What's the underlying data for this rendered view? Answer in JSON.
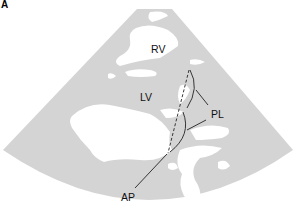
{
  "figure": {
    "panel_letter": "A",
    "colors": {
      "sector_fill": "#d4d4d4",
      "bright_echo": "#ffffff",
      "annotation_line": "#222222"
    }
  },
  "labels": {
    "rv": "RV",
    "lv": "LV",
    "pl": "PL",
    "ap": "AP"
  }
}
